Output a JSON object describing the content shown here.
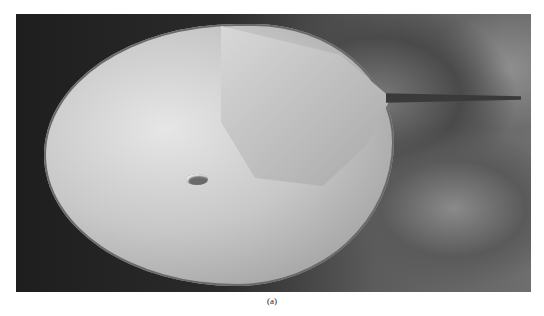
{
  "figure": {
    "caption": "(a)",
    "image": {
      "subject": "horseshoe crab on rocky seabed",
      "style": "grayscale photograph"
    }
  }
}
